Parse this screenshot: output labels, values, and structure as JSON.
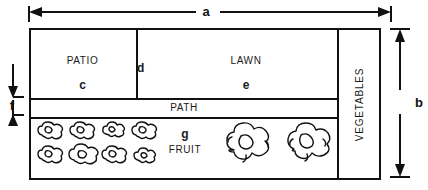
{
  "diagram": {
    "type": "dimensioned-plan-diagram"
  },
  "zones": {
    "patio": {
      "name": "PATIO",
      "area_letter": "c"
    },
    "divider_strip": {
      "area_letter": "d"
    },
    "lawn": {
      "name": "LAWN",
      "area_letter": "e"
    },
    "path": {
      "name": "PATH"
    },
    "fruit": {
      "name": "FRUIT",
      "area_letter": "g"
    },
    "vegetables": {
      "name": "VEGETABLES"
    }
  },
  "dimensions": {
    "overall_width": {
      "label": "a",
      "orientation": "horizontal",
      "position": "top",
      "arrow": "double-headed"
    },
    "overall_height": {
      "label": "b",
      "orientation": "vertical",
      "position": "right",
      "arrow": "double-headed"
    },
    "path_width": {
      "label": "f",
      "orientation": "vertical",
      "position": "left",
      "arrow": "double-headed-inward"
    }
  },
  "symbols": {
    "small_bush_count": 8,
    "small_bush_rows": 2,
    "small_bush_cols": 4,
    "large_shrub_count": 2
  },
  "colors": {
    "line": "#111111",
    "text": "#1a1a1a",
    "background": "#ffffff"
  }
}
